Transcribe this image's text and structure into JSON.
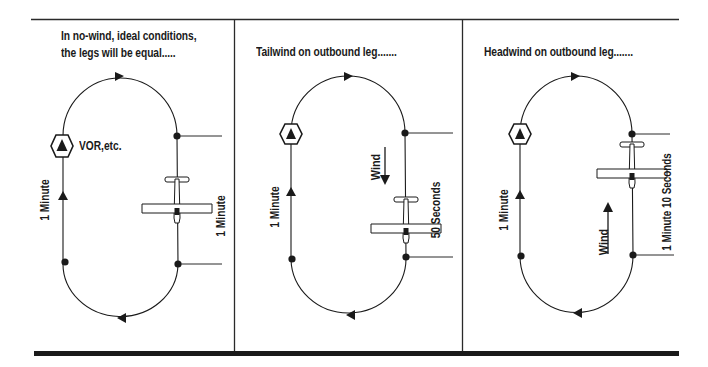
{
  "figure": {
    "colors": {
      "ink": "#1a1a1a",
      "background": "#ffffff",
      "aircraft_fill": "#ffffff"
    },
    "panels": [
      {
        "id": "no-wind",
        "caption_line1": "In no-wind, ideal conditions,",
        "caption_line2": "the legs will be equal.....",
        "inbound_leg_label": "1 Minute",
        "outbound_leg_label": "1 Minute",
        "fix_label": "VOR,etc.",
        "wind": null
      },
      {
        "id": "tailwind",
        "caption_line1": "Tailwind on outbound leg.......",
        "inbound_leg_label": "1 Minute",
        "outbound_leg_label": "50 Seconds",
        "wind_label": "Wind",
        "wind_direction": "down"
      },
      {
        "id": "headwind",
        "caption_line1": "Headwind on outbound leg.......",
        "inbound_leg_label": "1 Minute",
        "outbound_leg_label": "1 Minute 10 Seconds",
        "wind_label": "Wind",
        "wind_direction": "up"
      }
    ]
  }
}
